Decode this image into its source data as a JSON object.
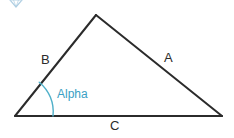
{
  "figure": {
    "background_color": "#ffffff",
    "stroke_color": "#2b2b2b",
    "accent_color": "#3a9fc4",
    "labels": {
      "side_a": "A",
      "side_b": "B",
      "side_c": "C",
      "angle_alpha": "Alpha"
    },
    "geometry": {
      "vertices": {
        "apex": [
          96,
          15
        ],
        "bottom_left": [
          15,
          116
        ],
        "bottom_right": [
          222,
          116
        ]
      },
      "sides": {
        "A": "apex-to-bottom-right",
        "B": "bottom-left-to-apex",
        "C": "bottom-left-to-bottom-right"
      },
      "angle_arc": {
        "at_vertex": "bottom_left",
        "radius": 38,
        "start_point": [
          39,
          82
        ],
        "end_point": [
          52,
          116
        ]
      }
    },
    "corner_mark": "diamond-icon"
  }
}
